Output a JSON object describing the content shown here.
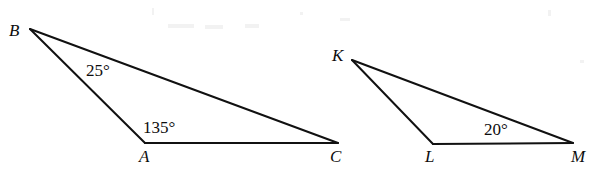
{
  "figure": {
    "background_color": "#ffffff",
    "stroke_color": "#111111",
    "text_color": "#0d0d0d",
    "width": 597,
    "height": 170,
    "triangles": [
      {
        "name": "triangle-ABC",
        "vertices": [
          {
            "label": "B",
            "x": 30,
            "y": 29,
            "label_x": 9,
            "label_y": 22
          },
          {
            "label": "A",
            "x": 145,
            "y": 143,
            "label_x": 139,
            "label_y": 148
          },
          {
            "label": "C",
            "x": 338,
            "y": 143,
            "label_x": 330,
            "label_y": 148
          }
        ],
        "angles": [
          {
            "at": "B",
            "value": "25°",
            "x": 86,
            "y": 62
          },
          {
            "at": "A",
            "value": "135°",
            "x": 143,
            "y": 119
          }
        ]
      },
      {
        "name": "triangle-KLM",
        "vertices": [
          {
            "label": "K",
            "x": 352,
            "y": 60,
            "label_x": 332,
            "label_y": 47
          },
          {
            "label": "L",
            "x": 433,
            "y": 144,
            "label_x": 425,
            "label_y": 148
          },
          {
            "label": "M",
            "x": 573,
            "y": 143,
            "label_x": 571,
            "label_y": 148
          }
        ],
        "angles": [
          {
            "at": "M",
            "value": "20°",
            "x": 484,
            "y": 121
          }
        ]
      }
    ]
  },
  "labels": {
    "B": "B",
    "A": "A",
    "C": "C",
    "K": "K",
    "L": "L",
    "M": "M",
    "angle_B": "25°",
    "angle_A": "135°",
    "angle_M": "20°"
  }
}
